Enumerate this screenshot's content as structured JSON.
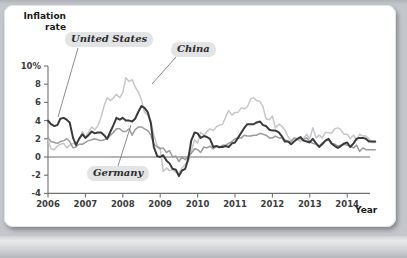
{
  "figure": {
    "y_axis_title_line1": "Inflation",
    "y_axis_title_line2": "rate",
    "x_axis_title": "Year",
    "colors": {
      "united_states": "#3a3a3c",
      "china": "#c6c7c9",
      "germany": "#9a9b9d",
      "axis": "#6f7072",
      "card_background": "#ffffff",
      "page_background": "#c3c6ca",
      "callout_background": "#e3e4e5"
    }
  },
  "callouts": [
    {
      "id": "united-states",
      "label": "United States"
    },
    {
      "id": "china",
      "label": "China"
    },
    {
      "id": "germany",
      "label": "Germany"
    }
  ],
  "chart_data": {
    "type": "line",
    "title": "",
    "xlabel": "Year",
    "ylabel": "Inflation rate",
    "xlim": [
      2006,
      2015
    ],
    "ylim": [
      -4,
      10
    ],
    "grid": false,
    "legend": "inline-callouts",
    "y_ticks": [
      -4,
      -2,
      0,
      2,
      4,
      6,
      8,
      10
    ],
    "y_tick_labels": [
      "-4",
      "-2",
      "0",
      "2",
      "4",
      "6",
      "8",
      "10%"
    ],
    "x_ticks": [
      2006,
      2007,
      2008,
      2009,
      2010,
      2011,
      2012,
      2013,
      2014
    ],
    "x_tick_labels": [
      "2006",
      "2007",
      "2008",
      "2009",
      "2010",
      "2011",
      "2012",
      "2013",
      "2014"
    ],
    "zero_line": 0,
    "series": [
      {
        "name": "United States",
        "color": "#3a3a3c",
        "x": [
          2006.0,
          2006.08,
          2006.17,
          2006.25,
          2006.33,
          2006.42,
          2006.5,
          2006.58,
          2006.67,
          2006.75,
          2006.83,
          2006.92,
          2007.0,
          2007.08,
          2007.17,
          2007.25,
          2007.33,
          2007.42,
          2007.5,
          2007.58,
          2007.67,
          2007.75,
          2007.83,
          2007.92,
          2008.0,
          2008.08,
          2008.17,
          2008.25,
          2008.33,
          2008.42,
          2008.5,
          2008.58,
          2008.67,
          2008.75,
          2008.83,
          2008.92,
          2009.0,
          2009.08,
          2009.17,
          2009.25,
          2009.33,
          2009.42,
          2009.5,
          2009.58,
          2009.67,
          2009.75,
          2009.83,
          2009.92,
          2010.0,
          2010.08,
          2010.17,
          2010.25,
          2010.33,
          2010.42,
          2010.5,
          2010.58,
          2010.67,
          2010.75,
          2010.83,
          2010.92,
          2011.0,
          2011.08,
          2011.17,
          2011.25,
          2011.33,
          2011.42,
          2011.5,
          2011.58,
          2011.67,
          2011.75,
          2011.83,
          2011.92,
          2012.0,
          2012.08,
          2012.17,
          2012.25,
          2012.33,
          2012.42,
          2012.5,
          2012.58,
          2012.67,
          2012.75,
          2012.83,
          2012.92,
          2013.0,
          2013.08,
          2013.17,
          2013.25,
          2013.33,
          2013.42,
          2013.5,
          2013.58,
          2013.67,
          2013.75,
          2013.83,
          2013.92,
          2014.0,
          2014.08,
          2014.17,
          2014.25,
          2014.33,
          2014.42,
          2014.5,
          2014.58,
          2014.67,
          2014.75
        ],
        "y": [
          4.0,
          3.6,
          3.4,
          3.5,
          4.2,
          4.3,
          4.1,
          3.8,
          2.1,
          1.3,
          2.0,
          2.5,
          2.1,
          2.4,
          2.8,
          2.6,
          2.7,
          2.7,
          2.4,
          2.0,
          2.8,
          3.5,
          4.3,
          4.1,
          4.3,
          4.0,
          4.0,
          3.9,
          4.2,
          5.0,
          5.6,
          5.4,
          4.9,
          3.7,
          1.1,
          0.1,
          0.0,
          0.2,
          -0.4,
          -0.7,
          -1.3,
          -1.4,
          -2.1,
          -1.5,
          -1.3,
          -0.2,
          1.8,
          2.7,
          2.6,
          2.1,
          2.3,
          2.2,
          2.0,
          1.1,
          1.2,
          1.1,
          1.1,
          1.2,
          1.1,
          1.5,
          1.6,
          2.1,
          2.7,
          3.2,
          3.6,
          3.6,
          3.6,
          3.8,
          3.9,
          3.5,
          3.4,
          3.0,
          2.9,
          2.9,
          2.7,
          2.3,
          1.7,
          1.7,
          1.4,
          1.7,
          2.0,
          2.2,
          1.8,
          1.7,
          1.6,
          2.0,
          1.5,
          1.1,
          1.4,
          1.8,
          2.0,
          1.5,
          1.2,
          1.0,
          1.2,
          1.5,
          1.6,
          1.1,
          1.5,
          2.0,
          2.1,
          2.1,
          2.0,
          1.7,
          1.7,
          1.7
        ]
      },
      {
        "name": "China",
        "color": "#c6c7c9",
        "x": [
          2006.0,
          2006.08,
          2006.17,
          2006.25,
          2006.33,
          2006.42,
          2006.5,
          2006.58,
          2006.67,
          2006.75,
          2006.83,
          2006.92,
          2007.0,
          2007.08,
          2007.17,
          2007.25,
          2007.33,
          2007.42,
          2007.5,
          2007.58,
          2007.67,
          2007.75,
          2007.83,
          2007.92,
          2008.0,
          2008.08,
          2008.17,
          2008.25,
          2008.33,
          2008.42,
          2008.5,
          2008.58,
          2008.67,
          2008.75,
          2008.83,
          2008.92,
          2009.0,
          2009.08,
          2009.17,
          2009.25,
          2009.33,
          2009.42,
          2009.5,
          2009.58,
          2009.67,
          2009.75,
          2009.83,
          2009.92,
          2010.0,
          2010.08,
          2010.17,
          2010.25,
          2010.33,
          2010.42,
          2010.5,
          2010.58,
          2010.67,
          2010.75,
          2010.83,
          2010.92,
          2011.0,
          2011.08,
          2011.17,
          2011.25,
          2011.33,
          2011.42,
          2011.5,
          2011.58,
          2011.67,
          2011.75,
          2011.83,
          2011.92,
          2012.0,
          2012.08,
          2012.17,
          2012.25,
          2012.33,
          2012.42,
          2012.5,
          2012.58,
          2012.67,
          2012.75,
          2012.83,
          2012.92,
          2013.0,
          2013.08,
          2013.17,
          2013.25,
          2013.33,
          2013.42,
          2013.5,
          2013.58,
          2013.67,
          2013.75,
          2013.83,
          2013.92,
          2014.0,
          2014.08,
          2014.17,
          2014.25,
          2014.33,
          2014.42,
          2014.5,
          2014.58,
          2014.67,
          2014.75
        ],
        "y": [
          1.9,
          0.9,
          0.8,
          1.2,
          1.4,
          1.5,
          1.0,
          1.3,
          1.5,
          1.4,
          1.9,
          2.8,
          2.2,
          2.7,
          3.3,
          3.0,
          3.4,
          4.4,
          5.6,
          6.5,
          6.2,
          6.5,
          6.9,
          6.5,
          7.1,
          8.7,
          8.3,
          8.5,
          7.7,
          7.1,
          6.3,
          4.9,
          4.6,
          4.0,
          2.4,
          1.2,
          1.0,
          -1.6,
          -1.2,
          -1.5,
          -1.4,
          -1.7,
          -1.8,
          -1.2,
          -0.8,
          -0.5,
          0.6,
          1.9,
          1.5,
          2.7,
          2.4,
          2.8,
          3.1,
          2.9,
          3.3,
          3.5,
          3.6,
          4.4,
          5.1,
          4.6,
          4.9,
          4.9,
          5.4,
          5.3,
          5.5,
          6.4,
          6.5,
          6.2,
          6.1,
          5.5,
          4.2,
          4.1,
          4.5,
          3.2,
          3.6,
          3.4,
          3.0,
          2.2,
          1.8,
          2.0,
          1.9,
          1.7,
          2.0,
          2.5,
          2.0,
          3.2,
          2.1,
          2.4,
          2.1,
          2.7,
          2.7,
          2.6,
          3.1,
          3.2,
          3.0,
          2.5,
          2.5,
          2.0,
          2.4,
          1.8,
          2.5,
          2.3,
          2.3,
          2.0,
          1.6,
          1.6
        ]
      },
      {
        "name": "Germany",
        "color": "#9a9b9d",
        "x": [
          2006.0,
          2006.08,
          2006.17,
          2006.25,
          2006.33,
          2006.42,
          2006.5,
          2006.58,
          2006.67,
          2006.75,
          2006.83,
          2006.92,
          2007.0,
          2007.08,
          2007.17,
          2007.25,
          2007.33,
          2007.42,
          2007.5,
          2007.58,
          2007.67,
          2007.75,
          2007.83,
          2007.92,
          2008.0,
          2008.08,
          2008.17,
          2008.25,
          2008.33,
          2008.42,
          2008.5,
          2008.58,
          2008.67,
          2008.75,
          2008.83,
          2008.92,
          2009.0,
          2009.08,
          2009.17,
          2009.25,
          2009.33,
          2009.42,
          2009.5,
          2009.58,
          2009.67,
          2009.75,
          2009.83,
          2009.92,
          2010.0,
          2010.08,
          2010.17,
          2010.25,
          2010.33,
          2010.42,
          2010.5,
          2010.58,
          2010.67,
          2010.75,
          2010.83,
          2010.92,
          2011.0,
          2011.08,
          2011.17,
          2011.25,
          2011.33,
          2011.42,
          2011.5,
          2011.58,
          2011.67,
          2011.75,
          2011.83,
          2011.92,
          2012.0,
          2012.08,
          2012.17,
          2012.25,
          2012.33,
          2012.42,
          2012.5,
          2012.58,
          2012.67,
          2012.75,
          2012.83,
          2012.92,
          2013.0,
          2013.08,
          2013.17,
          2013.25,
          2013.33,
          2013.42,
          2013.5,
          2013.58,
          2013.67,
          2013.75,
          2013.83,
          2013.92,
          2014.0,
          2014.08,
          2014.17,
          2014.25,
          2014.33,
          2014.42,
          2014.5,
          2014.58,
          2014.67,
          2014.75
        ],
        "y": [
          2.1,
          1.7,
          1.6,
          1.5,
          1.7,
          1.8,
          2.0,
          1.7,
          1.0,
          1.1,
          1.4,
          1.4,
          1.6,
          1.8,
          1.9,
          2.0,
          1.9,
          1.8,
          1.9,
          2.0,
          2.4,
          2.7,
          3.1,
          3.1,
          2.8,
          2.8,
          3.1,
          2.4,
          3.0,
          3.3,
          3.3,
          3.1,
          2.9,
          2.4,
          1.4,
          1.1,
          0.9,
          1.0,
          0.5,
          0.7,
          0.0,
          0.1,
          -0.5,
          0.0,
          -0.3,
          0.1,
          0.4,
          0.9,
          0.8,
          0.5,
          1.1,
          1.0,
          1.2,
          0.9,
          1.2,
          1.0,
          1.3,
          1.3,
          1.5,
          1.7,
          2.0,
          2.1,
          2.1,
          2.4,
          2.3,
          2.3,
          2.4,
          2.4,
          2.6,
          2.5,
          2.4,
          2.1,
          2.1,
          2.3,
          2.1,
          2.1,
          1.9,
          1.7,
          1.7,
          2.1,
          2.0,
          2.0,
          1.9,
          2.1,
          1.7,
          1.5,
          1.4,
          1.2,
          1.5,
          1.8,
          1.9,
          1.5,
          1.4,
          1.2,
          1.3,
          1.4,
          1.3,
          1.2,
          1.0,
          1.3,
          0.6,
          1.0,
          0.8,
          0.8,
          0.8,
          0.8
        ]
      }
    ]
  }
}
